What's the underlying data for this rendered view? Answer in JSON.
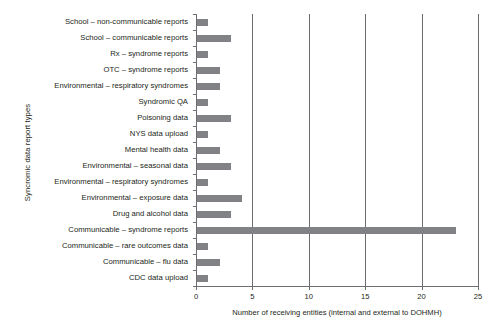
{
  "chart_data": {
    "type": "bar",
    "orientation": "horizontal",
    "title": "",
    "xlabel": "Number of receiving entities (internal and external to DOHMH)",
    "ylabel": "Syncromic data report types",
    "xlim": [
      0,
      25
    ],
    "xticks": [
      0,
      5,
      10,
      15,
      20,
      25
    ],
    "grid": true,
    "grid_axis": "x",
    "legend": false,
    "bar_color": "#808285",
    "axis_color": "#6d6e71",
    "text_color": "#231f20",
    "categories": [
      "School – non-communicable reports",
      "School – communicable reports",
      "Rx – syndrome reports",
      "OTC – syndrome reports",
      "Environmental – respiratory syndromes",
      "Syndromic QA",
      "Poisoning data",
      "NYS data upload",
      "Mental health data",
      "Environmental – seasonal data",
      "Environmental – respiratory syndromes",
      "Environmental – exposure data",
      "Drug and alcohol data",
      "Communicable – syndrome reports",
      "Communicable – rare outcomes data",
      "Communicable – flu data",
      "CDC data upload"
    ],
    "values": [
      1,
      3,
      1,
      2,
      2,
      1,
      3,
      1,
      2,
      3,
      1,
      4,
      3,
      23,
      1,
      2,
      1
    ]
  }
}
